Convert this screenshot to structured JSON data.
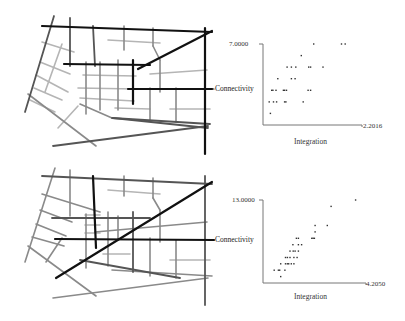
{
  "figure": {
    "panels": [
      {
        "id": "top",
        "map_label": "Connectivity",
        "scatter": {
          "y_max_label": "7.0000",
          "x_max_label": "2.2016",
          "x_axis_label": "Integration"
        }
      },
      {
        "id": "bottom",
        "map_label": "Connectivity",
        "scatter": {
          "y_max_label": "13.0000",
          "x_max_label": "4.2050",
          "x_axis_label": "Integration"
        }
      }
    ]
  },
  "colors": {
    "line_dark": "#111111",
    "line_mid": "#555555",
    "line_light": "#9a9a9a",
    "line_lighter": "#b5b5b5",
    "axis": "#666666",
    "point": "#333333"
  },
  "chart_data": [
    {
      "type": "scatter",
      "title": "",
      "xlabel": "Integration",
      "ylabel": "Connectivity",
      "xlim": [
        0.6,
        2.2016
      ],
      "ylim": [
        0,
        7.0
      ],
      "x_max_label": "2.2016",
      "y_max_label": "7.0000",
      "grid": false,
      "points": [
        [
          0.72,
          1.0
        ],
        [
          0.7,
          2.0
        ],
        [
          0.77,
          2.0
        ],
        [
          0.82,
          2.0
        ],
        [
          0.95,
          2.0
        ],
        [
          0.97,
          2.0
        ],
        [
          1.25,
          2.0
        ],
        [
          0.74,
          3.0
        ],
        [
          0.76,
          3.0
        ],
        [
          0.81,
          3.0
        ],
        [
          0.93,
          3.0
        ],
        [
          0.95,
          3.0
        ],
        [
          0.98,
          3.0
        ],
        [
          1.33,
          3.0
        ],
        [
          1.37,
          3.0
        ],
        [
          0.84,
          4.0
        ],
        [
          1.06,
          4.0
        ],
        [
          1.12,
          4.0
        ],
        [
          0.99,
          5.0
        ],
        [
          1.06,
          5.0
        ],
        [
          1.13,
          5.0
        ],
        [
          1.34,
          5.0
        ],
        [
          1.37,
          5.0
        ],
        [
          1.57,
          5.0
        ],
        [
          1.22,
          6.0
        ],
        [
          1.42,
          7.0
        ],
        [
          1.87,
          7.0
        ],
        [
          1.93,
          7.0
        ]
      ]
    },
    {
      "type": "scatter",
      "title": "",
      "xlabel": "Integration",
      "ylabel": "Connectivity",
      "xlim": [
        1.0,
        4.205
      ],
      "ylim": [
        0,
        13.0
      ],
      "x_max_label": "4.2050",
      "y_max_label": "13.0000",
      "grid": false,
      "points": [
        [
          1.35,
          2.0
        ],
        [
          1.55,
          1.0
        ],
        [
          1.48,
          2.0
        ],
        [
          1.52,
          2.0
        ],
        [
          1.68,
          2.0
        ],
        [
          1.55,
          3.0
        ],
        [
          1.7,
          3.0
        ],
        [
          1.76,
          3.0
        ],
        [
          1.8,
          3.0
        ],
        [
          1.88,
          3.0
        ],
        [
          1.96,
          3.0
        ],
        [
          1.7,
          4.0
        ],
        [
          1.76,
          4.0
        ],
        [
          1.84,
          4.0
        ],
        [
          1.96,
          4.0
        ],
        [
          2.06,
          4.0
        ],
        [
          1.84,
          5.0
        ],
        [
          1.94,
          5.0
        ],
        [
          2.0,
          5.0
        ],
        [
          2.1,
          5.0
        ],
        [
          1.93,
          6.0
        ],
        [
          2.1,
          6.0
        ],
        [
          2.2,
          6.0
        ],
        [
          2.04,
          7.0
        ],
        [
          2.1,
          7.0
        ],
        [
          2.52,
          7.0
        ],
        [
          2.56,
          7.0
        ],
        [
          2.6,
          7.0
        ],
        [
          2.62,
          8.0
        ],
        [
          2.62,
          9.0
        ],
        [
          3.0,
          9.0
        ],
        [
          3.12,
          12.0
        ],
        [
          3.88,
          13.0
        ]
      ]
    }
  ]
}
